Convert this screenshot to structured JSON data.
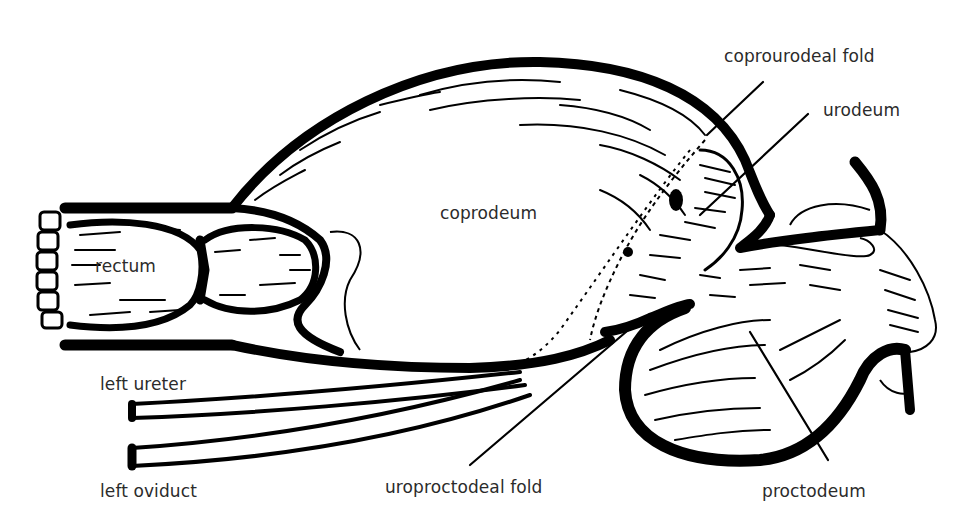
{
  "diagram": {
    "background": "#ffffff",
    "ink_color": "#000000",
    "label_color": "#2b2b2b"
  },
  "labels": {
    "coprourodeal_fold": "coprourodeal fold",
    "urodeum": "urodeum",
    "coprodeum": "coprodeum",
    "rectum": "rectum",
    "left_ureter": "left ureter",
    "left_oviduct": "left oviduct",
    "uroproctodeal_fold": "uroproctodeal fold",
    "proctodeum": "proctodeum"
  }
}
